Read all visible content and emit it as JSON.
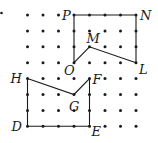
{
  "diagram": {
    "type": "dot-grid-polygons",
    "grid": {
      "columns": 8,
      "rows": 8,
      "x0": 27.5,
      "y0": 15,
      "dx": 15.5,
      "dy": 15.9,
      "dot_color": "#1a1a1a",
      "line_color": "#1a1a1a"
    },
    "stray_dot": {
      "x": 1.5,
      "y": 13
    },
    "points": {
      "P": {
        "c": 3,
        "r": 0,
        "label": "P",
        "lx": -12,
        "ly": 5
      },
      "N": {
        "c": 7,
        "r": 0,
        "label": "N",
        "lx": 4,
        "ly": 5
      },
      "L": {
        "c": 7,
        "r": 3,
        "label": "L",
        "lx": 3,
        "ly": 11
      },
      "M": {
        "c": 4,
        "r": 2,
        "label": "M",
        "lx": -3,
        "ly": -4
      },
      "O": {
        "c": 3,
        "r": 3,
        "label": "O",
        "lx": -10,
        "ly": 12
      },
      "H": {
        "c": 0,
        "r": 4,
        "label": "H",
        "lx": -17,
        "ly": 4
      },
      "F": {
        "c": 4,
        "r": 4,
        "label": "F",
        "lx": 3,
        "ly": 5
      },
      "G": {
        "c": 3,
        "r": 5,
        "label": "G",
        "lx": -5,
        "ly": 16
      },
      "E": {
        "c": 4,
        "r": 7,
        "label": "E",
        "lx": 2,
        "ly": 10
      },
      "D": {
        "c": 0,
        "r": 7,
        "label": "D",
        "lx": -16,
        "ly": 5
      }
    },
    "polygons": [
      {
        "name": "PNLMO",
        "vertices": [
          "P",
          "N",
          "L",
          "M",
          "O"
        ]
      },
      {
        "name": "HGFED",
        "vertices": [
          "H",
          "G",
          "F",
          "E",
          "D"
        ]
      }
    ]
  }
}
